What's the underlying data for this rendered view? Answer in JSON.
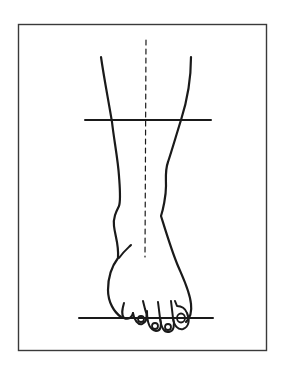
{
  "figure": {
    "type": "line-drawing",
    "colors": {
      "background": "#ffffff",
      "line": "#1a1a1a",
      "frame": "#3a3a3a"
    },
    "elements": {
      "frame": "rectangular border",
      "midline": "vertical dashed reference line",
      "upper_horizontal": "horizontal reference line across lower leg",
      "ground_line": "horizontal baseline under toes",
      "leg_outline": "outline of lower leg, ankle and foot",
      "toes": 5
    }
  }
}
